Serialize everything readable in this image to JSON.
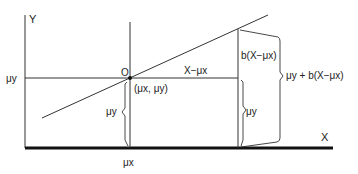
{
  "diagram": {
    "axes": {
      "y_label": "Y",
      "x_label": "X"
    },
    "labels": {
      "origin": "O",
      "mu_y_tick": "μy",
      "mu_x_tick": "μx",
      "mean_point": "(μx, μy)",
      "x_minus_mu_x": "X−μx",
      "b_term": "b(X−μx)",
      "mu_y_left_brace": "μy",
      "mu_y_right_brace": "μy",
      "predicted": "μy + b(X−μx)"
    },
    "colors": {
      "line": "#222222",
      "axis": "#111111",
      "background": "#ffffff"
    }
  }
}
